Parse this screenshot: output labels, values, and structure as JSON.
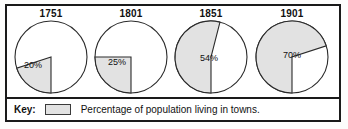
{
  "chart_data": [
    {
      "type": "pie",
      "title": "1751",
      "categories": [
        "Percentage of population living in towns",
        "Remainder"
      ],
      "values": [
        20,
        80
      ],
      "data_labels": [
        "20%"
      ],
      "start_angle_deg": 180,
      "direction": "clockwise",
      "legend": "Percentage of population living in towns."
    },
    {
      "type": "pie",
      "title": "1801",
      "categories": [
        "Percentage of population living in towns",
        "Remainder"
      ],
      "values": [
        25,
        75
      ],
      "data_labels": [
        "25%"
      ],
      "start_angle_deg": 180,
      "direction": "clockwise",
      "legend": "Percentage of population living in towns."
    },
    {
      "type": "pie",
      "title": "1851",
      "categories": [
        "Percentage of population living in towns",
        "Remainder"
      ],
      "values": [
        54,
        46
      ],
      "data_labels": [
        "54%"
      ],
      "start_angle_deg": 180,
      "direction": "clockwise",
      "legend": "Percentage of population living in towns."
    },
    {
      "type": "pie",
      "title": "1901",
      "categories": [
        "Percentage of population living in towns",
        "Remainder"
      ],
      "values": [
        70,
        30
      ],
      "data_labels": [
        "70%"
      ],
      "start_angle_deg": 180,
      "direction": "clockwise",
      "legend": "Percentage of population living in towns."
    }
  ],
  "charts": [
    {
      "year": "1751",
      "percent_label": "20%",
      "percent": 20
    },
    {
      "year": "1801",
      "percent_label": "25%",
      "percent": 25
    },
    {
      "year": "1851",
      "percent_label": "54%",
      "percent": 54
    },
    {
      "year": "1901",
      "percent_label": "70%",
      "percent": 70
    }
  ],
  "key": {
    "label": "Key:",
    "swatch_name": "shaded-swatch",
    "description": "Percentage of population living in towns."
  },
  "colors": {
    "slice_fill": "#e2e2e2",
    "slice_stroke": "#2b2b2b",
    "frame": "#1a1a1a",
    "text": "#111111",
    "background": "#ffffff"
  }
}
